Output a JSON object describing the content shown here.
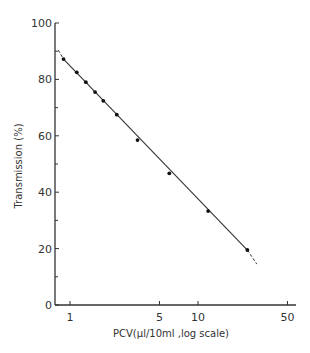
{
  "chart_data": {
    "type": "scatter",
    "title": "",
    "xlabel": "PCV(μl/10ml ,log scale)",
    "ylabel": "Transmission (%)",
    "xscale": "log",
    "xlim": [
      0.8,
      60
    ],
    "ylim": [
      0,
      100
    ],
    "x_ticks": [
      1,
      5,
      10,
      50
    ],
    "x_tick_labels": [
      "1",
      "5",
      "10",
      "50"
    ],
    "y_ticks": [
      0,
      20,
      40,
      60,
      80,
      100
    ],
    "y_tick_labels": [
      "0",
      "20",
      "40",
      "60",
      "80",
      "100"
    ],
    "y_minor_ticks": [
      10,
      30,
      50,
      70,
      90
    ],
    "grid": false,
    "legend": null,
    "series": [
      {
        "name": "measurements",
        "x": [
          0.89,
          1.13,
          1.33,
          1.57,
          1.82,
          2.32,
          3.37,
          5.97,
          12.0,
          24.3
        ],
        "y": [
          87.2,
          82.5,
          79.0,
          75.5,
          72.4,
          67.5,
          58.5,
          46.7,
          33.3,
          19.5
        ]
      }
    ],
    "fit_line": {
      "x": [
        0.81,
        28.8
      ],
      "y": [
        90.4,
        14.5
      ],
      "style": "solid with dashed extrapolated ends"
    }
  },
  "labels": {
    "x_axis": "PCV(μl/10ml ,log scale)",
    "y_axis": "Transmission (%)"
  }
}
